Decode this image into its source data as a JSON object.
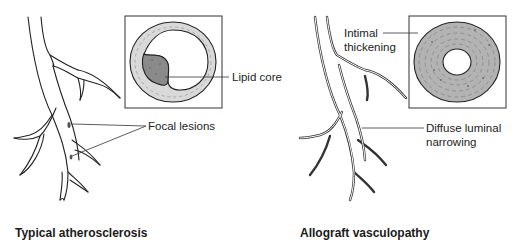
{
  "panels": [
    {
      "title": "Typical atherosclerosis",
      "labels": {
        "lipid_core": "Lipid core",
        "focal_lesions": "Focal lesions"
      }
    },
    {
      "title": "Allograft vasculopathy",
      "labels": {
        "intimal_line1": "Intimal",
        "intimal_line2": "thickening",
        "diffuse_line1": "Diffuse luminal",
        "diffuse_line2": "narrowing"
      }
    }
  ],
  "colors": {
    "outline": "#222222",
    "vessel_wall": "#d9d9d9",
    "lipid_core": "#8a8a8a",
    "thickened_intima": "#b3b3b3",
    "background": "#ffffff"
  }
}
